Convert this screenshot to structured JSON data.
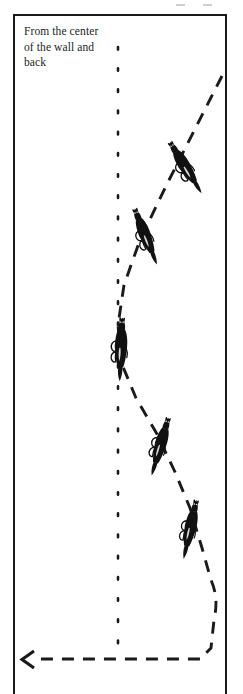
{
  "figure": {
    "type": "equestrian-dressage-school-figure-diagram",
    "caption": "From the center\nof the wall and\nback",
    "colors": {
      "ink": "#1a1a1a",
      "text": "#201e1e",
      "background": "#ffffff"
    },
    "arena": {
      "name": "riding-arena-rectangle",
      "border_style": "solid",
      "open_side": "bottom"
    },
    "center_line": {
      "name": "arena-center-line",
      "style": "dotted",
      "orientation": "vertical"
    },
    "track": {
      "name": "ridden-track-path",
      "style": "dashed",
      "direction_marker": "arrowhead-pointing-left",
      "description": "zigzag leg-yield track from the center of the wall and back"
    },
    "horses": [
      {
        "label": "horse-and-rider-1",
        "x": 186,
        "y": 168,
        "angle": -32,
        "scale": 1.0
      },
      {
        "label": "horse-and-rider-2",
        "x": 146,
        "y": 237,
        "angle": -22,
        "scale": 1.0
      },
      {
        "label": "horse-and-rider-3",
        "x": 121,
        "y": 350,
        "angle": 2,
        "scale": 1.06
      },
      {
        "label": "horse-and-rider-4",
        "x": 160,
        "y": 447,
        "angle": 16,
        "scale": 1.0
      },
      {
        "label": "horse-and-rider-5",
        "x": 190,
        "y": 530,
        "angle": 12,
        "scale": 1.0
      }
    ]
  }
}
